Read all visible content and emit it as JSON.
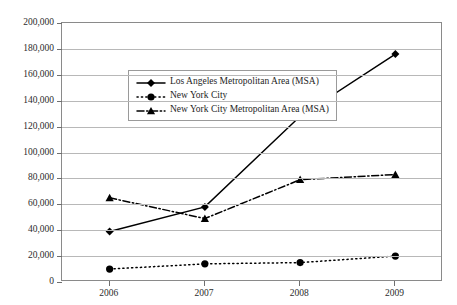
{
  "chart_data": {
    "type": "line",
    "title": "",
    "xlabel": "",
    "ylabel": "",
    "x": [
      "2006",
      "2007",
      "2008",
      "2009"
    ],
    "categories": [
      "2006",
      "2007",
      "2008",
      "2009"
    ],
    "ylim": [
      0,
      200000
    ],
    "ytick_step": 20000,
    "ytick_labels": [
      "200,000",
      "180,000",
      "160,000",
      "140,000",
      "120,000",
      "100,000",
      "80,000",
      "60,000",
      "40,000",
      "20,000",
      "0"
    ],
    "ytick_values": [
      200000,
      180000,
      160000,
      140000,
      120000,
      100000,
      80000,
      60000,
      40000,
      20000,
      0
    ],
    "grid": true,
    "legend_position": "upper-left-inside",
    "series": [
      {
        "name": "Los Angeles Metropolitan Area (MSA)",
        "values": [
          39000,
          58000,
          128000,
          176000
        ],
        "color": "#000000",
        "line_style": "solid",
        "marker": "diamond"
      },
      {
        "name": "New York City",
        "values": [
          10000,
          14000,
          15000,
          20000
        ],
        "color": "#000000",
        "line_style": "dotted",
        "marker": "circle"
      },
      {
        "name": "New York City Metropolitan Area (MSA)",
        "values": [
          65000,
          49000,
          79000,
          83000
        ],
        "color": "#000000",
        "line_style": "dashdot",
        "marker": "triangle"
      }
    ]
  }
}
